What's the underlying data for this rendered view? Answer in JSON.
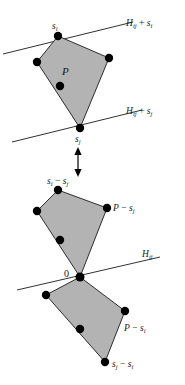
{
  "figure": {
    "colors": {
      "polygon_fill": "#b3b3b3",
      "stroke": "#1a1a1a",
      "vertex": "#000000",
      "background": "#ffffff"
    },
    "upper_panel": {
      "polygon_label": "P",
      "vertex_labels": {
        "top": {
          "base": "s",
          "sub": "i"
        },
        "bottom": {
          "base": "s",
          "sub": "j"
        }
      },
      "line_labels": [
        {
          "base": "H",
          "sub1": "ij",
          "op": " + ",
          "base2": "s",
          "sub2": "i"
        },
        {
          "base": "H",
          "sub1": "ij",
          "op": " + ",
          "base2": "s",
          "sub2": "j"
        }
      ]
    },
    "connector": {
      "icon": "double-headed-vertical-arrow"
    },
    "lower_panel": {
      "origin_label": "0",
      "line_label": {
        "base": "H",
        "sub1": "ij"
      },
      "upper_body_labels": {
        "top_vertex": {
          "base1": "s",
          "sub1": "i",
          "op": " − ",
          "base2": "s",
          "sub2": "j"
        },
        "side": {
          "base1": "P",
          "op": " − ",
          "base2": "s",
          "sub2": "j"
        }
      },
      "lower_body_labels": {
        "side": {
          "base1": "P",
          "op": " − ",
          "base2": "s",
          "sub2": "i"
        },
        "bottom_vertex": {
          "base1": "s",
          "sub1": "j",
          "op": " − ",
          "base2": "s",
          "sub2": "i"
        }
      }
    },
    "geometry": {
      "upper_polygon": [
        [
          58,
          36
        ],
        [
          37,
          62
        ],
        [
          80,
          128
        ],
        [
          109,
          58
        ]
      ],
      "upper_interior_dots": [
        [
          60,
          86
        ]
      ],
      "upper_vertex_dots": [
        [
          58,
          36
        ],
        [
          37,
          62
        ],
        [
          109,
          58
        ],
        [
          80,
          128
        ]
      ],
      "line_upper": [
        [
          3,
          53
        ],
        [
          130,
          22
        ]
      ],
      "line_lower": [
        [
          12,
          140
        ],
        [
          140,
          110
        ]
      ],
      "lower_upper_polygon": [
        [
          58,
          190
        ],
        [
          37,
          211
        ],
        [
          80,
          277
        ],
        [
          107,
          208
        ]
      ],
      "lower_upper_interior_dots": [
        [
          60,
          240
        ]
      ],
      "lower_lower_polygon": [
        [
          80,
          277
        ],
        [
          46,
          295
        ],
        [
          105,
          362
        ],
        [
          125,
          311
        ]
      ],
      "lower_lower_interior_dots": [
        [
          80,
          329
        ]
      ],
      "line_mid": [
        [
          17,
          287
        ],
        [
          160,
          257
        ]
      ]
    }
  }
}
